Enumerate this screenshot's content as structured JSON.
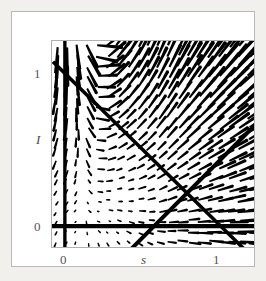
{
  "figure": {
    "domain": "chart",
    "background_color": "#f2f0ec",
    "card_color": "#ffffff",
    "card_border_color": "#b9b9b9",
    "plot_frame_color": "#b0b0b0",
    "ink_color": "#000000",
    "label_color": "#4a4a4a"
  },
  "chart_data": {
    "type": "scatter",
    "subtype": "direction-field-phase-portrait",
    "title": "",
    "xlabel": "s",
    "ylabel": "I",
    "xlim": [
      -0.1,
      1.18
    ],
    "ylim": [
      -0.09,
      1.25
    ],
    "grid": false,
    "legend": null,
    "x_ticks": [
      {
        "value": 0,
        "label": "0",
        "pixel_x": 52
      },
      {
        "value": 1,
        "label": "1",
        "pixel_x": 205
      }
    ],
    "y_ticks": [
      {
        "value": 0,
        "label": "0",
        "pixel_y": 215
      },
      {
        "value": 1,
        "label": "1",
        "pixel_y": 62
      }
    ],
    "axes_lines": [
      {
        "name": "I-equals-zero-axis",
        "kind": "horizontal",
        "value": 0,
        "weight": "heavy"
      },
      {
        "name": "s-equals-zero-axis",
        "kind": "vertical",
        "value": 0,
        "weight": "heavy"
      }
    ],
    "nullclines": [
      {
        "name": "descending-nullcline",
        "description": "line of negative slope from upper-left to lower-right",
        "from": {
          "s": -0.08,
          "I": 1.12
        },
        "to": {
          "s": 1.09,
          "I": -0.09
        },
        "slope": -1.03,
        "intercept": 1.04,
        "weight": "heavy"
      },
      {
        "name": "ascending-nullcline",
        "description": "line of positive slope from lower-left to upper-right",
        "from": {
          "s": 0.36,
          "I": -0.09
        },
        "to": {
          "s": 1.18,
          "I": 0.72
        },
        "slope": 0.99,
        "intercept": -0.45,
        "weight": "heavy"
      }
    ],
    "annotations": [
      {
        "text": "1",
        "role": "y-tick"
      },
      {
        "text": "0",
        "role": "y-tick"
      },
      {
        "text": "I",
        "role": "y-axis-label",
        "style": "italic"
      },
      {
        "text": "0",
        "role": "x-tick"
      },
      {
        "text": "s",
        "role": "x-axis-label",
        "style": "italic"
      },
      {
        "text": "1",
        "role": "x-tick"
      }
    ],
    "field": {
      "description": "Tapered direction-field arrows; short dots near lower-left, long strokes toward upper-right. Arrows in upper-left point steeply downward; arrows in upper-right point up and to the right.",
      "source_center": {
        "s": 0.12,
        "I": 0.02
      },
      "columns": 20,
      "rows": 20,
      "min_length_px": 2,
      "max_length_px": 30
    }
  },
  "axis": {
    "y_tick_top": "1",
    "y_tick_bottom": "0",
    "y_title": "I",
    "x_tick_left": "0",
    "x_tick_right": "1",
    "x_title": "s"
  }
}
